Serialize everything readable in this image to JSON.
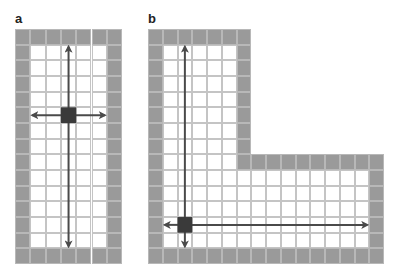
{
  "panels": [
    {
      "label": "a",
      "origin": [
        15,
        29
      ],
      "cell": [
        15.3,
        15.67
      ],
      "cols": 7,
      "rows": 15,
      "shape": "rectangle",
      "agent": {
        "col": 3,
        "row": 5
      },
      "arrows": {
        "left_col": 1,
        "right_col": 5,
        "top_row": 1,
        "bottom_row": 13
      }
    },
    {
      "label": "b",
      "origin": [
        148,
        29
      ],
      "cell": [
        14.75,
        15.67
      ],
      "cols": 16,
      "rows": 15,
      "shape": "L",
      "notch": {
        "col_start": 7,
        "row_end": 7
      },
      "agent": {
        "col": 2,
        "row": 12
      },
      "arrows": {
        "left_col": 1,
        "right_col": 14,
        "top_row": 1,
        "bottom_row": 13
      }
    }
  ],
  "colors": {
    "wall": "#9a9a9a",
    "floor": "#ffffff",
    "gridline": "#c4c4c4",
    "agent": "#3a3a3a",
    "arrow": "#4a4a4a"
  }
}
